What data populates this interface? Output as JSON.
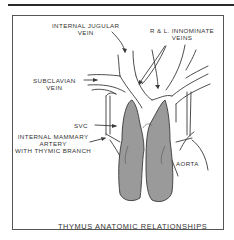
{
  "diagram": {
    "title": "THYMUS ANATOMIC RELATIONSHIPS",
    "labels": {
      "internal_jugular": [
        "INTERNAL JUGULAR",
        "VEIN"
      ],
      "innominate": [
        "R & L. INNOMINATE",
        "VEINS"
      ],
      "subclavian": [
        "SUBCLAVIAN",
        "VEIN"
      ],
      "svc": "SVC",
      "internal_mammary": [
        "INTERNAL MAMMARY",
        "ARTERY",
        "WITH THYMIC BRANCH"
      ],
      "aorta": "AORTA"
    },
    "colors": {
      "line": "#3a3a3a",
      "thymus_fill": "#9a9a9a",
      "text": "#333333"
    }
  }
}
